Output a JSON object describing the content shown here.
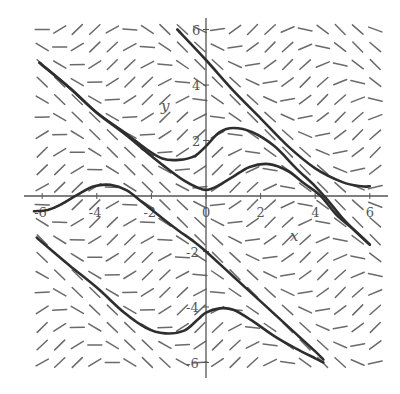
{
  "diagram": {
    "type": "slope_field",
    "x_axis_label": "x",
    "y_axis_label": "y",
    "x_range": [
      -6.5,
      6.5
    ],
    "y_range": [
      -6.5,
      6.5
    ],
    "x_ticks": [
      {
        "value": -6,
        "label": "-6"
      },
      {
        "value": -4,
        "label": "-4"
      },
      {
        "value": -2,
        "label": "-2"
      },
      {
        "value": 0,
        "label": "0"
      },
      {
        "value": 2,
        "label": "2"
      },
      {
        "value": 4,
        "label": "4"
      },
      {
        "value": 6,
        "label": "6"
      }
    ],
    "y_ticks": [
      {
        "value": 6,
        "label": "6"
      },
      {
        "value": 4,
        "label": "4"
      },
      {
        "value": 2,
        "label": "2"
      },
      {
        "value": -2,
        "label": "-2"
      },
      {
        "value": -4,
        "label": "-4"
      },
      {
        "value": -6,
        "label": "-6"
      }
    ],
    "field": {
      "grid_x_start": -6.0,
      "grid_y_start": 6.0,
      "spacing_x": 0.64,
      "spacing_y": 0.63,
      "columns": 20,
      "rows": 20,
      "slope_expression": "sin(x+y)"
    },
    "solution_curves": [
      {
        "name": "curve-upper-right",
        "points": [
          [
            -1.05,
            6.0
          ],
          [
            0,
            4.9
          ],
          [
            1,
            3.8
          ],
          [
            2,
            2.8
          ],
          [
            3,
            1.8
          ],
          [
            4,
            1.0
          ],
          [
            5,
            0.5
          ],
          [
            5.7,
            0.35
          ],
          [
            6.0,
            0.35
          ]
        ]
      },
      {
        "name": "curve-upper-left-a",
        "points": [
          [
            -6.1,
            4.8
          ],
          [
            -5,
            3.9
          ],
          [
            -4,
            3.0
          ],
          [
            -3,
            2.3
          ],
          [
            -2.2,
            1.7
          ],
          [
            -1.6,
            1.35
          ],
          [
            -1,
            1.3
          ],
          [
            -0.4,
            1.45
          ],
          [
            0,
            1.8
          ],
          [
            0.5,
            2.3
          ],
          [
            1,
            2.45
          ],
          [
            1.7,
            2.3
          ],
          [
            2.5,
            1.8
          ],
          [
            3.3,
            1.0
          ],
          [
            4,
            0.35
          ],
          [
            4.5,
            -0.2
          ],
          [
            5,
            -0.8
          ],
          [
            5.5,
            -1.3
          ],
          [
            6,
            -1.75
          ]
        ]
      },
      {
        "name": "curve-upper-left-b",
        "points": [
          [
            -6.1,
            4.8
          ],
          [
            -5,
            3.9
          ],
          [
            -4,
            3.0
          ],
          [
            -3,
            2.25
          ],
          [
            -2.2,
            1.6
          ],
          [
            -1.5,
            1.05
          ],
          [
            -0.8,
            0.55
          ],
          [
            -0.3,
            0.3
          ],
          [
            0,
            0.22
          ],
          [
            0.4,
            0.35
          ],
          [
            1,
            0.7
          ],
          [
            1.6,
            1.05
          ],
          [
            2.3,
            1.15
          ],
          [
            3,
            0.9
          ],
          [
            3.6,
            0.45
          ],
          [
            4.2,
            0.0
          ],
          [
            4.8,
            -0.7
          ],
          [
            5.4,
            -1.2
          ],
          [
            6,
            -1.75
          ]
        ]
      },
      {
        "name": "curve-left-hump",
        "points": [
          [
            -6.3,
            -0.55
          ],
          [
            -5.8,
            -0.5
          ],
          [
            -5.3,
            -0.3
          ],
          [
            -4.7,
            0.05
          ],
          [
            -4.1,
            0.35
          ],
          [
            -3.5,
            0.4
          ],
          [
            -2.9,
            0.2
          ],
          [
            -2.3,
            -0.25
          ],
          [
            -1.6,
            -0.8
          ],
          [
            -1,
            -1.25
          ],
          [
            -0.5,
            -1.6
          ],
          [
            0,
            -2.0
          ],
          [
            1,
            -2.9
          ],
          [
            2,
            -3.8
          ],
          [
            3,
            -4.7
          ],
          [
            4,
            -5.6
          ],
          [
            4.3,
            -5.9
          ]
        ]
      },
      {
        "name": "curve-lower",
        "points": [
          [
            -6.2,
            -1.5
          ],
          [
            -5,
            -2.5
          ],
          [
            -4,
            -3.3
          ],
          [
            -3,
            -4.2
          ],
          [
            -2.2,
            -4.75
          ],
          [
            -1.5,
            -4.95
          ],
          [
            -0.8,
            -4.85
          ],
          [
            -0.3,
            -4.45
          ],
          [
            0,
            -4.2
          ],
          [
            0.5,
            -4.05
          ],
          [
            1,
            -4.1
          ],
          [
            1.7,
            -4.5
          ],
          [
            2.5,
            -5.05
          ],
          [
            3.3,
            -5.5
          ],
          [
            4,
            -5.85
          ],
          [
            4.3,
            -6.0
          ]
        ]
      }
    ]
  }
}
